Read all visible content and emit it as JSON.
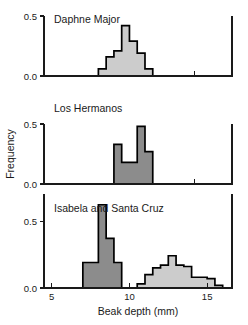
{
  "figure": {
    "ylabel": "Frequency",
    "xlabel": "Beak depth (mm)",
    "xticks": [
      "5",
      "10",
      "15"
    ],
    "xtick_values": [
      5,
      10,
      15
    ],
    "xlim": [
      4.5,
      16.6
    ],
    "colors": {
      "dark_fill": "#8c8c8c",
      "light_fill": "#cccccc",
      "outline": "#000000",
      "axis": "#1a1a1a",
      "background": "#ffffff"
    }
  },
  "chart_data": [
    {
      "type": "bar",
      "title": "Daphne Major",
      "panel_index": 0,
      "xlabel": "",
      "ylabel": "Frequency",
      "ylim": [
        0,
        0.5
      ],
      "yticks": [
        0.0,
        0.5
      ],
      "ytick_labels": [
        "0.0",
        "0.5"
      ],
      "xlim": [
        4.5,
        16.6
      ],
      "grid": false,
      "legend": "none",
      "bin_width": 0.5,
      "series": [
        {
          "name": "Daphne Major beak depth",
          "fill": "light",
          "bin_starts": [
            8.0,
            8.5,
            9.0,
            9.5,
            10.0,
            10.5,
            11.0
          ],
          "categories": [
            "8.0-8.5",
            "8.5-9.0",
            "9.0-9.5",
            "9.5-10.0",
            "10.0-10.5",
            "10.5-11.0",
            "11.0-11.5"
          ],
          "values": [
            0.06,
            0.16,
            0.21,
            0.42,
            0.29,
            0.19,
            0.06
          ]
        }
      ]
    },
    {
      "type": "bar",
      "title": "Los Hermanos",
      "panel_index": 1,
      "xlabel": "",
      "ylabel": "Frequency",
      "ylim": [
        0,
        0.5
      ],
      "yticks": [
        0.0,
        0.5
      ],
      "ytick_labels": [
        "0.0",
        "0.5"
      ],
      "xlim": [
        4.5,
        16.6
      ],
      "grid": false,
      "legend": "none",
      "bin_width": 0.5,
      "series": [
        {
          "name": "Los Hermanos beak depth",
          "fill": "dark",
          "bin_starts": [
            9.0,
            9.5,
            10.0,
            10.5,
            11.0
          ],
          "categories": [
            "9.0-9.5",
            "9.5-10.0",
            "10.0-10.5",
            "10.5-11.0",
            "11.0-11.5"
          ],
          "values": [
            0.33,
            0.18,
            0.18,
            0.48,
            0.27
          ]
        }
      ]
    },
    {
      "type": "bar",
      "title": "Isabela and Santa Cruz",
      "panel_index": 2,
      "xlabel": "Beak depth (mm)",
      "ylabel": "Frequency",
      "ylim": [
        0,
        0.7
      ],
      "yticks": [
        0.0,
        0.5
      ],
      "ytick_labels": [
        "0.0",
        "0.5"
      ],
      "xlim": [
        4.5,
        16.6
      ],
      "grid": false,
      "legend": "none",
      "bin_width": 0.5,
      "series": [
        {
          "name": "Small-beak mode (dark)",
          "fill": "dark",
          "bin_starts": [
            7.0,
            7.5,
            8.0,
            8.5,
            9.0
          ],
          "categories": [
            "7.0-7.5",
            "7.5-8.0",
            "8.0-8.5",
            "8.5-9.0",
            "9.0-9.5"
          ],
          "values": [
            0.19,
            0.19,
            0.62,
            0.37,
            0.19
          ]
        },
        {
          "name": "Large-beak mode (light)",
          "fill": "light",
          "bin_starts": [
            10.5,
            11.0,
            11.5,
            12.0,
            12.5,
            13.0,
            13.5,
            14.0,
            14.5,
            15.0,
            15.5
          ],
          "categories": [
            "10.5-11.0",
            "11.0-11.5",
            "11.5-12.0",
            "12.0-12.5",
            "12.5-13.0",
            "13.0-13.5",
            "13.5-14.0",
            "14.0-14.5",
            "14.5-15.0",
            "15.0-15.5",
            "15.5-16.0"
          ],
          "values": [
            0.03,
            0.1,
            0.15,
            0.17,
            0.24,
            0.17,
            0.16,
            0.08,
            0.08,
            0.07,
            0.02
          ]
        }
      ]
    }
  ]
}
